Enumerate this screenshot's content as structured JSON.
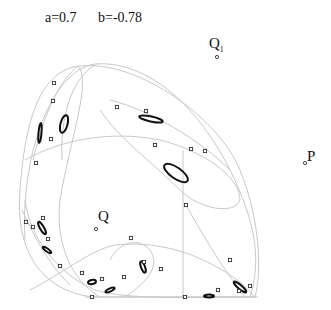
{
  "header": {
    "param_a": "a=0.7",
    "param_b": "b=-0.78"
  },
  "labels": {
    "Q1": "Q",
    "Q1_sub": "1",
    "P": "P",
    "Q": "Q"
  },
  "points": [
    {
      "name": "Q1",
      "x": 244,
      "y": 57
    },
    {
      "name": "P",
      "x": 306,
      "y": 163
    },
    {
      "name": "Q",
      "x": 96,
      "y": 229
    }
  ],
  "markers": [
    [
      54,
      83
    ],
    [
      53,
      101
    ],
    [
      117,
      107
    ],
    [
      51,
      139
    ],
    [
      146,
      111
    ],
    [
      155,
      145
    ],
    [
      191,
      149
    ],
    [
      205,
      151
    ],
    [
      36,
      163
    ],
    [
      43,
      218
    ],
    [
      26,
      222
    ],
    [
      33,
      227
    ],
    [
      48,
      239
    ],
    [
      60,
      266
    ],
    [
      82,
      273
    ],
    [
      102,
      279
    ],
    [
      124,
      277
    ],
    [
      92,
      297
    ],
    [
      144,
      262
    ],
    [
      131,
      238
    ],
    [
      161,
      269
    ],
    [
      185,
      297
    ],
    [
      230,
      260
    ],
    [
      218,
      290
    ],
    [
      239,
      291
    ],
    [
      250,
      286
    ],
    [
      186,
      205
    ]
  ],
  "colors": {
    "curve": "#c8c8c8",
    "loop": "#111111",
    "marker": "#333333",
    "background": "#ffffff"
  }
}
